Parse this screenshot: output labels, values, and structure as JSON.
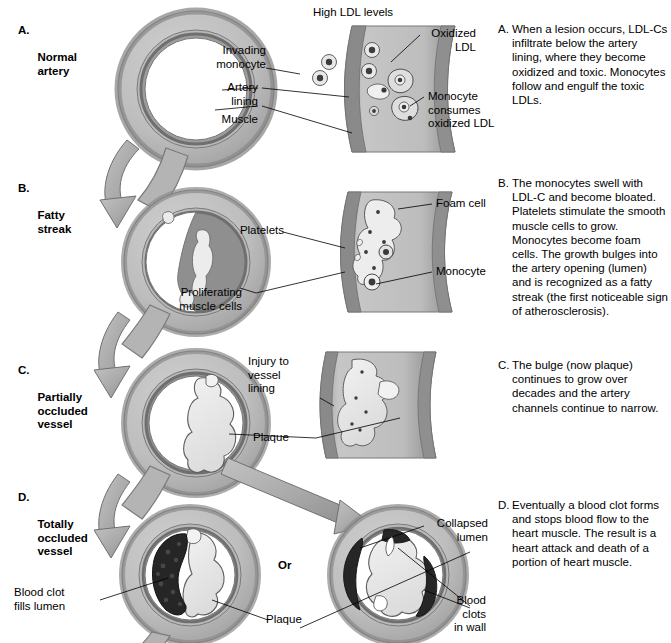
{
  "figure": {
    "panel_header": "High LDL levels",
    "or_divider": "Or"
  },
  "colors": {
    "outer_wall": "#8f8f8f",
    "muscle": "#b9b9b9",
    "lining": "#9a9a9a",
    "lumen": "#ffffff",
    "plaque": "#e8e8e8",
    "clot": "#2b2b2b",
    "arrow": "#a9a9a9",
    "outline": "#4a4a4a",
    "text": "#000000"
  },
  "stages": [
    {
      "letter": "A.",
      "name": "Normal\nartery"
    },
    {
      "letter": "B.",
      "name": "Fatty\nstreak"
    },
    {
      "letter": "C.",
      "name": "Partially\noccluded\nvessel"
    },
    {
      "letter": "D.",
      "name": "Totally\noccluded\nvessel"
    }
  ],
  "notes": [
    {
      "marker": "A.",
      "text": "When a lesion occurs, LDL-Cs infiltrate below the artery lining, where they become oxidized and toxic. Monocytes follow and engulf the toxic LDLs."
    },
    {
      "marker": "B.",
      "text": "The monocytes swell with LDL-C and become bloated. Platelets stimulate the smooth muscle cells to grow. Monocytes become foam cells. The growth bulges into the artery opening (lumen) and is recognized as a fatty streak (the first noticeable sign of atherosclerosis)."
    },
    {
      "marker": "C.",
      "text": "The bulge (now plaque) continues to grow over decades and the artery channels continue to narrow."
    },
    {
      "marker": "D.",
      "text": "Eventually a blood clot forms and stops blood flow to the heart muscle. The result is a heart attack and death of a portion of heart muscle."
    }
  ],
  "callouts": {
    "a_invading_monocyte": "Invading\nmonocyte",
    "a_artery_lining": "Artery\nlining",
    "a_muscle": "Muscle",
    "a_oxidized_ldl": "Oxidized\nLDL",
    "a_monocyte_consumes": "Monocyte\nconsumes\noxidized LDL",
    "b_platelets": "Platelets",
    "b_proliferating": "Proliferating\nmuscle cells",
    "b_foam_cell": "Foam cell",
    "b_monocyte": "Monocyte",
    "c_injury": "Injury to\nvessel\nlining",
    "c_plaque": "Plaque",
    "d_blood_clot_fills": "Blood clot\nfills lumen",
    "d_plaque": "Plaque",
    "d_collapsed_lumen": "Collapsed\nlumen",
    "d_blood_clots_wall": "Blood\nclots\nin wall"
  }
}
